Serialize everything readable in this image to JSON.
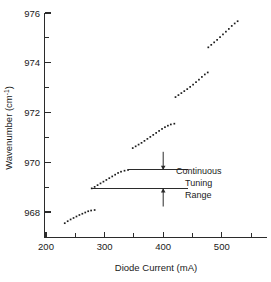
{
  "chart_data": {
    "type": "scatter",
    "title": "",
    "xlabel": "Diode Current (mA)",
    "ylabel": "Wavenumber (cm",
    "ylabel_sup": "-1",
    "ylabel_tail": ")",
    "xlim": [
      200,
      560
    ],
    "ylim": [
      967.2,
      976
    ],
    "xticks_major": [
      200,
      300,
      400,
      500
    ],
    "xticks_minor": [
      250,
      350,
      450,
      550
    ],
    "yticks_major": [
      968,
      970,
      972,
      974,
      976
    ],
    "yticks_minor": [
      969,
      971,
      973,
      975
    ],
    "xtick_labels": [
      "200",
      "300",
      "400",
      "500"
    ],
    "ytick_labels": [
      "968",
      "970",
      "972",
      "974",
      "976"
    ],
    "grid": false,
    "legend": "none",
    "marker": "small-square-dot",
    "series": [
      {
        "name": "mode-branch-1",
        "points": [
          [
            232.0,
            967.55
          ],
          [
            237.0,
            967.63
          ],
          [
            242.0,
            967.7
          ],
          [
            247.0,
            967.76
          ],
          [
            252.0,
            967.82
          ],
          [
            257.0,
            967.88
          ],
          [
            262.0,
            967.93
          ],
          [
            267.0,
            967.98
          ],
          [
            272.0,
            968.03
          ],
          [
            277.0,
            968.06
          ],
          [
            283.0,
            968.08
          ]
        ]
      },
      {
        "name": "mode-branch-2",
        "points": [
          [
            278.0,
            968.95
          ],
          [
            283.0,
            969.01
          ],
          [
            288.0,
            969.08
          ],
          [
            293.0,
            969.15
          ],
          [
            298.0,
            969.22
          ],
          [
            303.0,
            969.29
          ],
          [
            308.0,
            969.36
          ],
          [
            313.0,
            969.43
          ],
          [
            318.0,
            969.5
          ],
          [
            323.0,
            969.57
          ],
          [
            328.0,
            969.62
          ],
          [
            334.0,
            969.66
          ],
          [
            340.0,
            969.69
          ]
        ]
      },
      {
        "name": "mode-branch-3",
        "points": [
          [
            348.0,
            970.57
          ],
          [
            353.0,
            970.64
          ],
          [
            358.0,
            970.71
          ],
          [
            363.0,
            970.78
          ],
          [
            368.0,
            970.86
          ],
          [
            373.0,
            970.94
          ],
          [
            378.0,
            971.02
          ],
          [
            383.0,
            971.1
          ],
          [
            388.0,
            971.18
          ],
          [
            393.0,
            971.26
          ],
          [
            398.0,
            971.34
          ],
          [
            403.0,
            971.41
          ],
          [
            408.0,
            971.47
          ],
          [
            413.0,
            971.52
          ],
          [
            419.0,
            971.55
          ]
        ]
      },
      {
        "name": "mode-branch-4",
        "points": [
          [
            421.0,
            972.62
          ],
          [
            426.0,
            972.7
          ],
          [
            431.0,
            972.78
          ],
          [
            436.0,
            972.86
          ],
          [
            441.0,
            972.94
          ],
          [
            446.0,
            973.03
          ],
          [
            451.0,
            973.12
          ],
          [
            456.0,
            973.22
          ],
          [
            461.0,
            973.32
          ],
          [
            466.0,
            973.43
          ],
          [
            471.0,
            973.53
          ],
          [
            476.0,
            973.61
          ]
        ]
      },
      {
        "name": "mode-branch-5",
        "points": [
          [
            477.0,
            974.62
          ],
          [
            482.0,
            974.72
          ],
          [
            487.0,
            974.82
          ],
          [
            492.0,
            974.92
          ],
          [
            497.0,
            975.03
          ],
          [
            502.0,
            975.14
          ],
          [
            507.0,
            975.25
          ],
          [
            512.0,
            975.36
          ],
          [
            517.0,
            975.48
          ],
          [
            522.0,
            975.58
          ],
          [
            527.0,
            975.67
          ]
        ]
      }
    ],
    "annotations": [
      {
        "name": "continuous-tuning-range",
        "lines": [
          "Continuous",
          "Tuning",
          "Range"
        ],
        "upper_level": 969.69,
        "lower_level": 968.95,
        "upper_line_x": [
          340,
          442
        ],
        "lower_line_x": [
          278,
          442
        ],
        "arrow_x": 400,
        "arrow_top": 970.42,
        "arrow_bottom": 968.22
      }
    ]
  }
}
